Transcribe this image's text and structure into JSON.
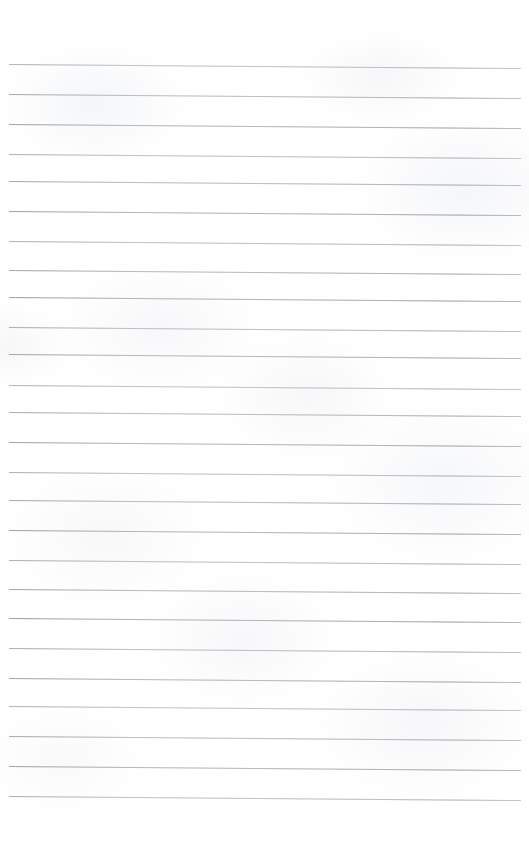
{
  "document": {
    "kind": "scanned-ruled-notebook-page",
    "title": "Blank ruled notebook page",
    "page_width": 529,
    "page_height": 863,
    "background_color": "#ffffff",
    "written_content": "",
    "header_text": "",
    "footer_text": "",
    "page_number": "",
    "has_margin_rule": false,
    "has_holes": false
  },
  "ruling": {
    "line_color": "#b9bdc5",
    "line_thickness_px": 1,
    "left_margin_px": 9,
    "right_margin_px": 8,
    "skew_degrees": 0.45,
    "spacing_px": 30,
    "line_count": 25,
    "first_line_y": 64,
    "last_line_y": 796,
    "line_y_positions": [
      64,
      94,
      124,
      154,
      181,
      211,
      241,
      270,
      297,
      327,
      354,
      385,
      412,
      442,
      472,
      500,
      530,
      560,
      589,
      618,
      648,
      678,
      706,
      736,
      766,
      796
    ]
  },
  "texture": {
    "show_through_opacity": 0.06,
    "paper_tint": "#f6f7f9"
  }
}
